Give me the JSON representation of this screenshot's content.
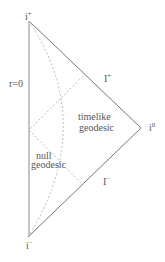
{
  "diagram": {
    "type": "Penrose diagram (Minkowski spacetime, half)",
    "labels": {
      "i_plus": "i",
      "i_plus_sup": "+",
      "i_minus": "i",
      "i_minus_sup": "−",
      "i_zero": "i",
      "i_zero_sup": "0",
      "scri_plus": "I",
      "scri_plus_sup": "+",
      "scri_minus": "I",
      "scri_minus_sup": "−",
      "r_zero": "r=0",
      "timelike_1": "timelike",
      "timelike_2": "geodesic",
      "null_1": "null",
      "null_2": "geodesic"
    },
    "colors": {
      "boundary": "#777777",
      "dashed": "#bbbbbb",
      "text": "#555555"
    }
  }
}
